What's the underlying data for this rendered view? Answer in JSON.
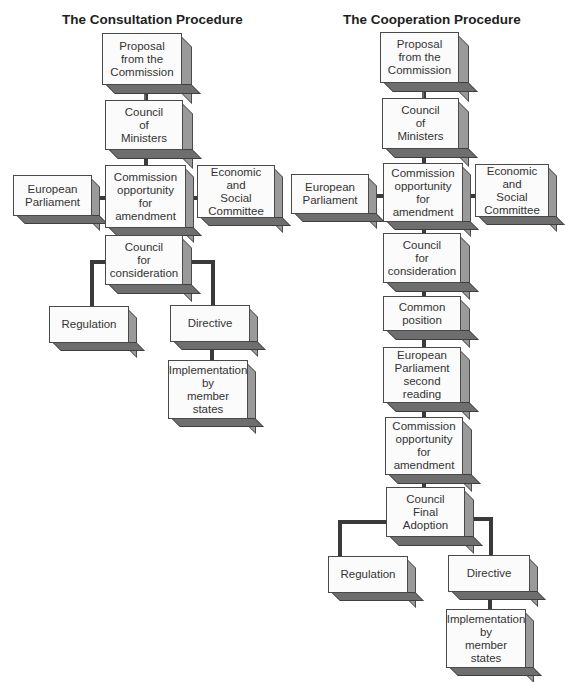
{
  "consultation": {
    "title": "The Consultation Procedure",
    "boxes": {
      "proposal": "Proposal\nfrom the\nCommission",
      "council_ministers": "Council\nof\nMinisters",
      "commission_amendment": "Commission\nopportunity\nfor\namendment",
      "european_parliament": "European\nParliament",
      "ecosoc": "Economic\nand\nSocial\nCommittee",
      "council_consideration": "Council\nfor\nconsideration",
      "regulation": "Regulation",
      "directive": "Directive",
      "implementation": "Implementation\nby\nmember\nstates"
    }
  },
  "cooperation": {
    "title": "The Cooperation Procedure",
    "boxes": {
      "proposal": "Proposal\nfrom the\nCommission",
      "council_ministers": "Council\nof\nMinisters",
      "commission_amendment": "Commission\nopportunity\nfor\namendment",
      "european_parliament": "European\nParliament",
      "ecosoc": "Economic\nand\nSocial\nCommittee",
      "council_consideration": "Council\nfor\nconsideration",
      "common_position": "Common\nposition",
      "ep_second_reading": "European\nParliament\nsecond\nreading",
      "commission_amendment_2": "Commission\nopportunity\nfor\namendment",
      "council_final_adoption": "Council\nFinal\nAdoption",
      "regulation": "Regulation",
      "directive": "Directive",
      "implementation": "Implementation\nby\nmember\nstates"
    }
  },
  "colors": {
    "front": "#fbfbfb",
    "side": "#9a9a9a",
    "bottom": "#6e6e6e",
    "connector": "#3a3a3a"
  }
}
